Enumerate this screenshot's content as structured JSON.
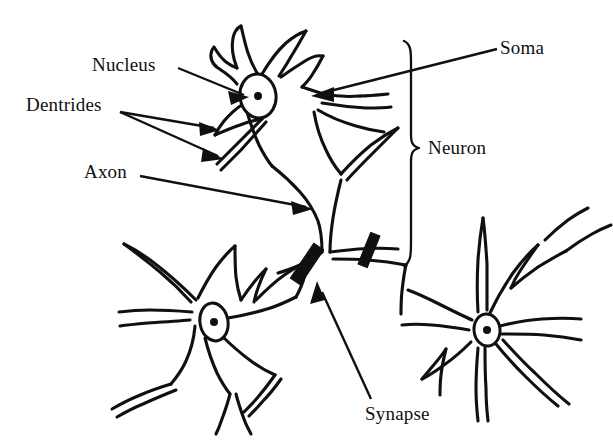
{
  "figure": {
    "style": "line-drawing",
    "background_color": "#ffffff",
    "ink_color": "#101010",
    "width": 613,
    "height": 446
  },
  "labels": {
    "nucleus": "Nucleus",
    "dentrides": "Dentrides",
    "axon": "Axon",
    "soma": "Soma",
    "neuron": "Neuron",
    "synapse": "Synapse"
  },
  "diagram": {
    "neuron_count": 3,
    "neurons": [
      {
        "name": "main-neuron",
        "position": "top-center",
        "has_nucleus": true,
        "nucleus_center": [
          258,
          96
        ]
      },
      {
        "name": "lower-left-neuron",
        "position": "bottom-left",
        "has_nucleus": true,
        "nucleus_center": [
          214,
          322
        ]
      },
      {
        "name": "right-neuron",
        "position": "bottom-right",
        "has_nucleus": true,
        "nucleus_center": [
          487,
          330
        ]
      }
    ],
    "synapse_markers": [
      {
        "name": "synapse-bar-left",
        "center": [
          307,
          264
        ]
      },
      {
        "name": "synapse-bar-right",
        "center": [
          369,
          250
        ]
      }
    ],
    "brace": {
      "name": "neuron-brace",
      "orientation": "vertical-right-facing",
      "top": 40,
      "bottom": 268,
      "x": 410,
      "mid": 148
    },
    "leaders": [
      {
        "name": "nucleus-leader",
        "from": [
          178,
          68
        ],
        "to": [
          247,
          97
        ],
        "arrow": "end"
      },
      {
        "name": "dentrides-leader-upper",
        "from": [
          120,
          112
        ],
        "to": [
          218,
          130
        ],
        "arrow": "end"
      },
      {
        "name": "dentrides-leader-lower",
        "from": [
          120,
          112
        ],
        "to": [
          222,
          158
        ],
        "arrow": "end"
      },
      {
        "name": "axon-leader",
        "from": [
          140,
          176
        ],
        "to": [
          312,
          209
        ],
        "arrow": "end"
      },
      {
        "name": "soma-leader",
        "from": [
          497,
          49
        ],
        "to": [
          313,
          96
        ],
        "arrow": "end"
      },
      {
        "name": "synapse-leader",
        "from": [
          371,
          399
        ],
        "to": [
          317,
          283
        ],
        "arrow": "end"
      }
    ]
  }
}
